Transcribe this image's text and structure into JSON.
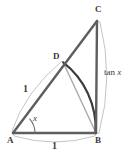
{
  "figure": {
    "type": "geometry-diagram",
    "canvas": {
      "width": 138,
      "height": 153,
      "background": "#ffffff"
    },
    "colors": {
      "stroke_dark": "#5b5b5b",
      "stroke_mid": "#8a8a8a",
      "stroke_light": "#b9b9b9",
      "arc_emphasis": "#3a3a3a",
      "text": "#3b3b3b"
    },
    "points": [
      {
        "id": "A",
        "label": "A",
        "x": 13,
        "y": 133,
        "label_x": 7,
        "label_y": 136
      },
      {
        "id": "B",
        "label": "B",
        "x": 96,
        "y": 133,
        "label_x": 95,
        "label_y": 136
      },
      {
        "id": "C",
        "label": "C",
        "x": 97,
        "y": 21,
        "label_x": 95,
        "label_y": 5
      },
      {
        "id": "D",
        "label": "D",
        "x": 63,
        "y": 62,
        "label_x": 53,
        "label_y": 52
      }
    ],
    "segments": [
      {
        "id": "AB",
        "from": "A",
        "to": "B",
        "weight": "heavy"
      },
      {
        "id": "AC",
        "from": "A",
        "to": "C",
        "weight": "heavy"
      },
      {
        "id": "BC",
        "from": "B",
        "to": "C",
        "weight": "heavy"
      },
      {
        "id": "DB",
        "from": "D",
        "to": "B",
        "weight": "light"
      }
    ],
    "arcs": [
      {
        "id": "arc-DB-unit",
        "description": "unit circle arc from D to B centred at A",
        "emphasis": true
      },
      {
        "id": "arc-angle-x",
        "description": "angle marker arc at vertex A",
        "emphasis": false
      },
      {
        "id": "brace-AD",
        "description": "measure brace along AD",
        "emphasis": false
      },
      {
        "id": "brace-AB",
        "description": "measure brace along AB",
        "emphasis": false
      },
      {
        "id": "brace-CB",
        "description": "measure brace along CB",
        "emphasis": false
      }
    ],
    "measure_labels": [
      {
        "id": "len-AD",
        "text": "1",
        "x": 23,
        "y": 84
      },
      {
        "id": "len-AB",
        "text": "1",
        "x": 52,
        "y": 141
      },
      {
        "id": "angle-A",
        "text": "x",
        "x": 33,
        "y": 114
      }
    ],
    "expression_labels": [
      {
        "id": "len-BC",
        "prefix": "tan ",
        "variable": "x",
        "x": 104,
        "y": 68
      }
    ]
  }
}
